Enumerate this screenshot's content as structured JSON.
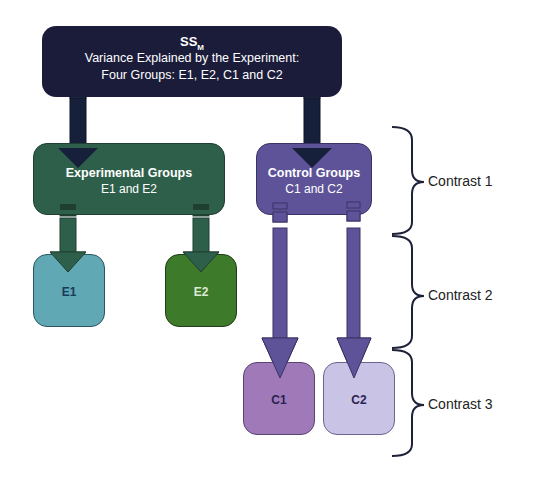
{
  "top_box": {
    "title": "SS",
    "title_sub": "M",
    "line1": "Variance Explained by the Experiment:",
    "line2": "Four Groups: E1, E2, C1 and C2",
    "color": "#1b1c3a"
  },
  "experimental_box": {
    "title": "Experimental Groups",
    "subtitle": "E1 and E2",
    "color": "#2e5f4b"
  },
  "control_box": {
    "title": "Control Groups",
    "subtitle": "C1 and C2",
    "color": "#5e5399"
  },
  "leaves": {
    "e1": {
      "label": "E1",
      "color": "#5fa8b4"
    },
    "e2": {
      "label": "E2",
      "color": "#3d7a2a"
    },
    "c1": {
      "label": "C1",
      "color": "#a07ab8"
    },
    "c2": {
      "label": "C2",
      "color": "#c9c3e6"
    }
  },
  "contrasts": [
    {
      "label": "Contrast 1"
    },
    {
      "label": "Contrast 2"
    },
    {
      "label": "Contrast 3"
    }
  ]
}
